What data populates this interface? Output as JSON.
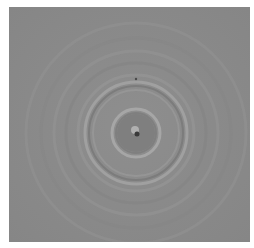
{
  "image": {
    "description": "Grayscale microscopy image of concentric interference rings around a central particle",
    "background_color": "#8b8b8b",
    "center": {
      "x": 127,
      "y": 126
    },
    "rings": [
      {
        "r": 110,
        "color": "#939393",
        "width": 3,
        "opacity": 0.5
      },
      {
        "r": 95,
        "color": "#858585",
        "width": 3,
        "opacity": 0.5
      },
      {
        "r": 82,
        "color": "#959595",
        "width": 3,
        "opacity": 0.6
      },
      {
        "r": 70,
        "color": "#848484",
        "width": 3,
        "opacity": 0.6
      },
      {
        "r": 58,
        "color": "#969696",
        "width": 3,
        "opacity": 0.7
      },
      {
        "r": 51,
        "color": "#a2a2a2",
        "width": 3,
        "opacity": 0.9
      },
      {
        "r": 47,
        "color": "#7a7a7a",
        "width": 2,
        "opacity": 0.9
      },
      {
        "r": 43,
        "color": "#9a9a9a",
        "width": 2,
        "opacity": 0.7
      },
      {
        "r": 24,
        "color": "#a8a8a8",
        "width": 3,
        "opacity": 0.9
      },
      {
        "r": 20,
        "color": "#7c7c7c",
        "width": 2,
        "opacity": 0.8
      }
    ],
    "inner_disk": {
      "r": 19,
      "color": "#7f7f7f"
    },
    "center_dot": {
      "r": 2.5,
      "color": "#3a3a3a"
    },
    "center_highlight": {
      "r": 4,
      "color": "#b0b0b0"
    },
    "top_speck": {
      "x": 127,
      "y": 72,
      "r": 1.2,
      "color": "#4a4a4a"
    }
  }
}
